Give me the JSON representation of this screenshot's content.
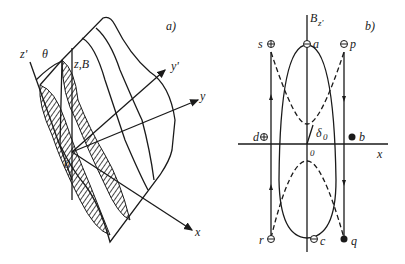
{
  "panel_a": {
    "label": "a)",
    "axes": {
      "z_prime": "z'",
      "z_B": "z,B",
      "y_prime": "y'",
      "y": "y",
      "x": "x",
      "origin": "0"
    },
    "angle_label": "θ"
  },
  "panel_b": {
    "label": "b)",
    "axes": {
      "vertical": "B",
      "vertical_sub": "z'",
      "horizontal": "x",
      "origin": "0"
    },
    "angle_label": "δ",
    "angle_sub": "0",
    "points": {
      "a": "a",
      "b": "b",
      "c": "c",
      "d": "d",
      "p": "p",
      "q": "q",
      "r": "r",
      "s": "s"
    }
  }
}
